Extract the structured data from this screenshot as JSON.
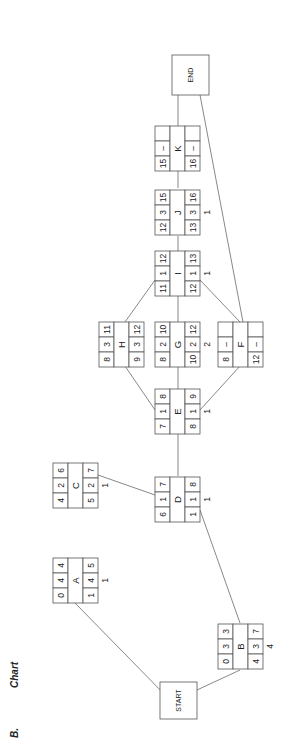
{
  "section_label": "B.",
  "section_title": "Chart",
  "orientation": "rotated-90-ccw",
  "colors": {
    "stroke": "#555555",
    "text": "#222222",
    "background": "#ffffff"
  },
  "terminals": {
    "start": {
      "label": "START"
    },
    "end": {
      "label": "END"
    }
  },
  "nodes": {
    "A": {
      "label": "A",
      "es": "0",
      "dur": "4",
      "ef": "4",
      "ls": "1",
      "dur2": "4",
      "lf": "5",
      "slack": "1"
    },
    "B": {
      "label": "B",
      "es": "0",
      "dur": "3",
      "ef": "3",
      "ls": "4",
      "dur2": "3",
      "lf": "7",
      "slack": "4"
    },
    "C": {
      "label": "C",
      "es": "4",
      "dur": "2",
      "ef": "6",
      "ls": "5",
      "dur2": "2",
      "lf": "7",
      "slack": "1"
    },
    "D": {
      "label": "D",
      "es": "6",
      "dur": "1",
      "ef": "7",
      "ls": "1",
      "dur2": "1",
      "lf": "8",
      "slack": "1"
    },
    "E": {
      "label": "E",
      "es": "7",
      "dur": "1",
      "ef": "8",
      "ls": "8",
      "dur2": "1",
      "lf": "9",
      "slack": "1"
    },
    "H": {
      "label": "H",
      "es": "8",
      "dur": "3",
      "ef": "11",
      "ls": "9",
      "dur2": "3",
      "lf": "12",
      "slack": ""
    },
    "G": {
      "label": "G",
      "es": "8",
      "dur": "2",
      "ef": "10",
      "ls": "10",
      "dur2": "2",
      "lf": "12",
      "slack": "2"
    },
    "F": {
      "label": "F",
      "es": "8",
      "dur": "–",
      "ef": "",
      "ls": "12",
      "dur2": "–",
      "lf": "",
      "slack": ""
    },
    "I": {
      "label": "I",
      "es": "11",
      "dur": "1",
      "ef": "12",
      "ls": "12",
      "dur2": "1",
      "lf": "13",
      "slack": "1"
    },
    "J": {
      "label": "J",
      "es": "12",
      "dur": "3",
      "ef": "15",
      "ls": "13",
      "dur2": "3",
      "lf": "16",
      "slack": "1"
    },
    "K": {
      "label": "K",
      "es": "15",
      "dur": "–",
      "ef": "",
      "ls": "16",
      "dur2": "–",
      "lf": "",
      "slack": ""
    }
  },
  "edges": [
    [
      "START",
      "A"
    ],
    [
      "START",
      "B"
    ],
    [
      "C",
      "D"
    ],
    [
      "B",
      "D"
    ],
    [
      "D",
      "E"
    ],
    [
      "E",
      "H"
    ],
    [
      "E",
      "G"
    ],
    [
      "E",
      "F"
    ],
    [
      "H",
      "I"
    ],
    [
      "G",
      "I"
    ],
    [
      "I",
      "F"
    ],
    [
      "I",
      "J"
    ],
    [
      "J",
      "K"
    ],
    [
      "K",
      "END"
    ],
    [
      "F",
      "END"
    ]
  ]
}
